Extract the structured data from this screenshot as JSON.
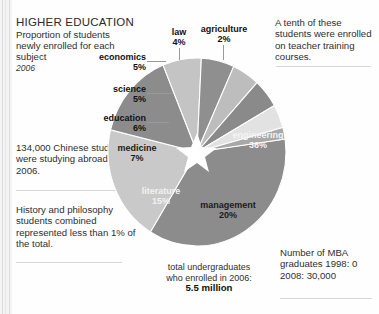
{
  "header": {
    "title": "HIGHER EDUCATION",
    "subtitle": "Proportion of students newly enrolled for each subject",
    "year": "2006"
  },
  "notes": {
    "abroad": "134,000 Chinese students were studying abroad in 2006.",
    "history": "History and philosophy students combined represented less than 1% of the total.",
    "teacher": "A tenth of these students were enrolled on teacher training courses.",
    "mba": "Number of MBA graduates 1998: 0 2008: 30,000"
  },
  "caption": {
    "line1": "total undergraduates",
    "line2": "who enrolled in 2006:",
    "value": "5.5 million"
  },
  "labels": {
    "engineering": "engineering",
    "engineering_pct": "36%",
    "management": "management",
    "management_pct": "20%",
    "literature": "literature",
    "literature_pct": "15%",
    "medicine": "medicine",
    "medicine_pct": "7%",
    "education": "education",
    "education_pct": "6%",
    "science": "science",
    "science_pct": "5%",
    "economics": "economics",
    "economics_pct": "5%",
    "law": "law",
    "law_pct": "4%",
    "agriculture": "agriculture",
    "agriculture_pct": "2%"
  },
  "chart_data": {
    "type": "pie",
    "title": "HIGHER EDUCATION",
    "subtitle": "Proportion of students newly enrolled for each subject",
    "year": "2006",
    "units": "percent of newly enrolled students",
    "total_label": "total undergraduates who enrolled in 2006: 5.5 million",
    "categories": [
      "engineering",
      "management",
      "literature",
      "medicine",
      "education",
      "science",
      "economics",
      "law",
      "agriculture"
    ],
    "values": [
      36,
      20,
      15,
      7,
      6,
      5,
      5,
      4,
      2
    ],
    "colors": [
      "#8c8c8c",
      "#c9c9c9",
      "#8c8c8c",
      "#c4c4c4",
      "#8f8f8f",
      "#bdbdbd",
      "#8a8a8a",
      "#e2e2e2",
      "#a8a8a8"
    ],
    "label_positions": [
      "inside",
      "inside",
      "inside",
      "inside",
      "outside",
      "outside",
      "outside",
      "outside",
      "outside"
    ],
    "legend": "none",
    "start_angle_deg": -8,
    "direction": "clockwise",
    "center_marker": "white-star",
    "annotations": [
      "A tenth of these students were enrolled on teacher training courses.",
      "134,000 Chinese students were studying abroad in 2006.",
      "History and philosophy students combined represented less than 1% of the total.",
      "Number of MBA graduates 1998: 0 2008: 30,000"
    ]
  }
}
